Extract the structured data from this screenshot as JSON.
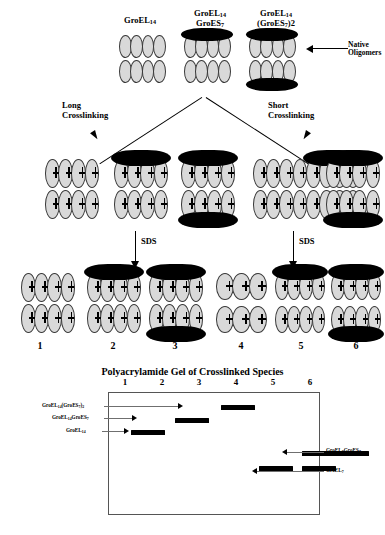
{
  "figure": {
    "native_label": {
      "line1": "Native",
      "line2": "Oligomers"
    },
    "top_complexes": [
      {
        "name": "groel14",
        "label_line1": "GroEL",
        "label_sub1": "14",
        "label_line2": "",
        "label_sub2": "",
        "caps": "none"
      },
      {
        "name": "groel14-groes7",
        "label_line1": "GroEL",
        "label_sub1": "14",
        "label_line2": "GroES",
        "label_sub2": "7",
        "caps": "top"
      },
      {
        "name": "groel14-groes7-2",
        "label_line1": "GroEL",
        "label_sub1": "14",
        "label_line2": "(GroES",
        "label_sub2": "7)2",
        "caps": "both"
      }
    ],
    "branches": [
      {
        "name": "long",
        "line1": "Long",
        "line2": "Crosslinking"
      },
      {
        "name": "short",
        "line1": "Short",
        "line2": "Crosslinking"
      }
    ],
    "sds_label": "SDS",
    "lane_numbers": [
      "1",
      "2",
      "3",
      "4",
      "5",
      "6"
    ]
  },
  "gel": {
    "title": "Polyacrylamide Gel of Crosslinked Species",
    "lane_numbers": [
      "1",
      "2",
      "3",
      "4",
      "5",
      "6"
    ],
    "left_labels": [
      {
        "name": "groel14-groes7-2",
        "text": "GroEL",
        "sub1": "14",
        "text2": "(GroES",
        "sub2": "7)2"
      },
      {
        "name": "groel14-groes7",
        "text": "GroEL",
        "sub1": "14",
        "text2": "GroES",
        "sub2": "7"
      },
      {
        "name": "groel14",
        "text": "GroEL",
        "sub1": "14",
        "text2": "",
        "sub2": ""
      }
    ],
    "right_labels": [
      {
        "name": "groel7-groes7",
        "text": "GroEL",
        "sub1": "7",
        "text2": "GroES",
        "sub2": "7"
      },
      {
        "name": "groel7",
        "text": "GroEL",
        "sub1": "7",
        "text2": "",
        "sub2": ""
      }
    ],
    "bands": [
      {
        "lane": 1,
        "name": "band-lane1-groel14",
        "x": 22,
        "y": 37,
        "w": 34
      },
      {
        "lane": 2,
        "name": "band-lane2-groel14groes7",
        "x": 66,
        "y": 25,
        "w": 34
      },
      {
        "lane": 3,
        "name": "band-lane3-groel14groes72",
        "x": 112,
        "y": 12,
        "w": 34
      },
      {
        "lane": 4,
        "name": "band-lane4-groel7",
        "x": 150,
        "y": 73,
        "w": 34
      },
      {
        "lane": 5,
        "name": "band-lane5-groel7groes7",
        "x": 193,
        "y": 58,
        "w": 34
      },
      {
        "lane": 5,
        "name": "band-lane5-groel7",
        "x": 193,
        "y": 73,
        "w": 34
      },
      {
        "lane": 6,
        "name": "band-lane6-groel7groes7",
        "x": 226,
        "y": 58,
        "w": 34
      }
    ]
  }
}
